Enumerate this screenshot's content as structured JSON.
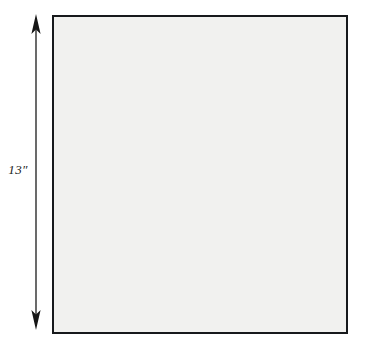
{
  "figure": {
    "kind": "astronomical-image",
    "background_color": "#ffffff"
  },
  "scale_bar": {
    "label": "13″",
    "value": 13,
    "unit": "arcsec",
    "orientation": "vertical",
    "arrowheads": "double",
    "color": "#2b2b2b",
    "top_y": 14,
    "bottom_y": 330
  },
  "image_panel": {
    "frame_color": "#17191c",
    "frame_width_px": 2,
    "left": 52,
    "top": 15,
    "width": 296,
    "height": 319,
    "colormap": "inverted-greyscale",
    "sky_background_color": "#f1f1ef",
    "star_core_color": "#111111"
  },
  "chart_data": {
    "type": "scatter",
    "title": "",
    "xlabel": "",
    "ylabel": "",
    "xlim": [
      0,
      292
    ],
    "ylim": [
      0,
      315
    ],
    "grid": false,
    "legend": null,
    "note": "Each point is a resolved star; r = core radius in px, i = peak darkness 0-1, h = halo radius in px",
    "points": [
      {
        "x": 18,
        "y": 16,
        "r": 2.0,
        "i": 0.45,
        "h": 7
      },
      {
        "x": 40,
        "y": 10,
        "r": 1.6,
        "i": 0.35,
        "h": 6
      },
      {
        "x": 8,
        "y": 56,
        "r": 6.5,
        "i": 0.86,
        "h": 20
      },
      {
        "x": 58,
        "y": 30,
        "r": 2.2,
        "i": 0.5,
        "h": 8
      },
      {
        "x": 86,
        "y": 22,
        "r": 1.8,
        "i": 0.4,
        "h": 7
      },
      {
        "x": 110,
        "y": 14,
        "r": 2.6,
        "i": 0.55,
        "h": 9
      },
      {
        "x": 134,
        "y": 34,
        "r": 2.0,
        "i": 0.45,
        "h": 7
      },
      {
        "x": 152,
        "y": 12,
        "r": 1.7,
        "i": 0.38,
        "h": 6
      },
      {
        "x": 176,
        "y": 26,
        "r": 3.0,
        "i": 0.6,
        "h": 10
      },
      {
        "x": 196,
        "y": 8,
        "r": 5.2,
        "i": 0.88,
        "h": 16
      },
      {
        "x": 214,
        "y": 44,
        "r": 2.4,
        "i": 0.52,
        "h": 9
      },
      {
        "x": 232,
        "y": 20,
        "r": 4.6,
        "i": 0.8,
        "h": 15
      },
      {
        "x": 254,
        "y": 12,
        "r": 2.0,
        "i": 0.45,
        "h": 7
      },
      {
        "x": 274,
        "y": 34,
        "r": 2.8,
        "i": 0.58,
        "h": 10
      },
      {
        "x": 286,
        "y": 14,
        "r": 1.8,
        "i": 0.4,
        "h": 6
      },
      {
        "x": 30,
        "y": 74,
        "r": 2.2,
        "i": 0.48,
        "h": 8
      },
      {
        "x": 54,
        "y": 62,
        "r": 1.8,
        "i": 0.4,
        "h": 7
      },
      {
        "x": 76,
        "y": 80,
        "r": 4.4,
        "i": 0.78,
        "h": 14
      },
      {
        "x": 96,
        "y": 58,
        "r": 2.0,
        "i": 0.44,
        "h": 7
      },
      {
        "x": 120,
        "y": 72,
        "r": 2.6,
        "i": 0.55,
        "h": 9
      },
      {
        "x": 140,
        "y": 60,
        "r": 1.9,
        "i": 0.42,
        "h": 7
      },
      {
        "x": 162,
        "y": 84,
        "r": 3.4,
        "i": 0.66,
        "h": 12
      },
      {
        "x": 184,
        "y": 66,
        "r": 2.1,
        "i": 0.46,
        "h": 8
      },
      {
        "x": 206,
        "y": 88,
        "r": 2.9,
        "i": 0.58,
        "h": 10
      },
      {
        "x": 228,
        "y": 70,
        "r": 2.3,
        "i": 0.5,
        "h": 8
      },
      {
        "x": 248,
        "y": 92,
        "r": 3.6,
        "i": 0.7,
        "h": 12
      },
      {
        "x": 268,
        "y": 64,
        "r": 2.0,
        "i": 0.44,
        "h": 7
      },
      {
        "x": 284,
        "y": 82,
        "r": 2.5,
        "i": 0.54,
        "h": 9
      },
      {
        "x": 12,
        "y": 96,
        "r": 2.0,
        "i": 0.44,
        "h": 7
      },
      {
        "x": 34,
        "y": 112,
        "r": 2.4,
        "i": 0.52,
        "h": 9
      },
      {
        "x": 58,
        "y": 104,
        "r": 1.8,
        "i": 0.4,
        "h": 7
      },
      {
        "x": 82,
        "y": 120,
        "r": 2.7,
        "i": 0.56,
        "h": 10
      },
      {
        "x": 104,
        "y": 100,
        "r": 5.6,
        "i": 0.9,
        "h": 18
      },
      {
        "x": 126,
        "y": 118,
        "r": 2.2,
        "i": 0.48,
        "h": 8
      },
      {
        "x": 146,
        "y": 102,
        "r": 3.2,
        "i": 0.64,
        "h": 11
      },
      {
        "x": 168,
        "y": 124,
        "r": 2.0,
        "i": 0.45,
        "h": 7
      },
      {
        "x": 188,
        "y": 106,
        "r": 4.0,
        "i": 0.74,
        "h": 13
      },
      {
        "x": 210,
        "y": 128,
        "r": 2.5,
        "i": 0.53,
        "h": 9
      },
      {
        "x": 234,
        "y": 108,
        "r": 3.0,
        "i": 0.62,
        "h": 10
      },
      {
        "x": 256,
        "y": 126,
        "r": 2.2,
        "i": 0.48,
        "h": 8
      },
      {
        "x": 278,
        "y": 104,
        "r": 2.8,
        "i": 0.58,
        "h": 10
      },
      {
        "x": 16,
        "y": 140,
        "r": 2.6,
        "i": 0.55,
        "h": 9
      },
      {
        "x": 44,
        "y": 152,
        "r": 2.0,
        "i": 0.44,
        "h": 7
      },
      {
        "x": 68,
        "y": 136,
        "r": 1.9,
        "i": 0.42,
        "h": 7
      },
      {
        "x": 92,
        "y": 156,
        "r": 2.4,
        "i": 0.52,
        "h": 9
      },
      {
        "x": 116,
        "y": 142,
        "r": 4.2,
        "i": 0.76,
        "h": 14
      },
      {
        "x": 138,
        "y": 160,
        "r": 2.1,
        "i": 0.46,
        "h": 8
      },
      {
        "x": 160,
        "y": 138,
        "r": 2.9,
        "i": 0.6,
        "h": 10
      },
      {
        "x": 182,
        "y": 158,
        "r": 2.3,
        "i": 0.5,
        "h": 8
      },
      {
        "x": 204,
        "y": 144,
        "r": 3.4,
        "i": 0.67,
        "h": 12
      },
      {
        "x": 226,
        "y": 164,
        "r": 2.0,
        "i": 0.44,
        "h": 7
      },
      {
        "x": 250,
        "y": 146,
        "r": 4.8,
        "i": 0.84,
        "h": 16
      },
      {
        "x": 272,
        "y": 162,
        "r": 2.6,
        "i": 0.55,
        "h": 9
      },
      {
        "x": 288,
        "y": 140,
        "r": 2.0,
        "i": 0.44,
        "h": 7
      },
      {
        "x": 21,
        "y": 187,
        "r": 9.5,
        "i": 0.97,
        "h": 30
      },
      {
        "x": 52,
        "y": 180,
        "r": 2.0,
        "i": 0.44,
        "h": 7
      },
      {
        "x": 74,
        "y": 196,
        "r": 2.4,
        "i": 0.52,
        "h": 9
      },
      {
        "x": 98,
        "y": 182,
        "r": 1.9,
        "i": 0.42,
        "h": 7
      },
      {
        "x": 122,
        "y": 200,
        "r": 2.7,
        "i": 0.57,
        "h": 10
      },
      {
        "x": 144,
        "y": 184,
        "r": 2.2,
        "i": 0.48,
        "h": 8
      },
      {
        "x": 166,
        "y": 204,
        "r": 3.0,
        "i": 0.62,
        "h": 10
      },
      {
        "x": 190,
        "y": 186,
        "r": 2.5,
        "i": 0.53,
        "h": 9
      },
      {
        "x": 212,
        "y": 206,
        "r": 2.1,
        "i": 0.46,
        "h": 8
      },
      {
        "x": 236,
        "y": 188,
        "r": 3.8,
        "i": 0.72,
        "h": 13
      },
      {
        "x": 258,
        "y": 208,
        "r": 2.3,
        "i": 0.5,
        "h": 8
      },
      {
        "x": 280,
        "y": 190,
        "r": 4.4,
        "i": 0.78,
        "h": 14
      },
      {
        "x": 14,
        "y": 226,
        "r": 2.2,
        "i": 0.48,
        "h": 8
      },
      {
        "x": 38,
        "y": 244,
        "r": 1.8,
        "i": 0.4,
        "h": 7
      },
      {
        "x": 62,
        "y": 228,
        "r": 2.6,
        "i": 0.55,
        "h": 9
      },
      {
        "x": 86,
        "y": 248,
        "r": 2.0,
        "i": 0.44,
        "h": 7
      },
      {
        "x": 110,
        "y": 232,
        "r": 3.2,
        "i": 0.64,
        "h": 11
      },
      {
        "x": 132,
        "y": 252,
        "r": 2.4,
        "i": 0.51,
        "h": 9
      },
      {
        "x": 156,
        "y": 230,
        "r": 6.2,
        "i": 0.92,
        "h": 20
      },
      {
        "x": 180,
        "y": 250,
        "r": 2.1,
        "i": 0.46,
        "h": 8
      },
      {
        "x": 202,
        "y": 234,
        "r": 2.8,
        "i": 0.58,
        "h": 10
      },
      {
        "x": 224,
        "y": 254,
        "r": 2.0,
        "i": 0.44,
        "h": 7
      },
      {
        "x": 248,
        "y": 236,
        "r": 3.6,
        "i": 0.7,
        "h": 12
      },
      {
        "x": 270,
        "y": 256,
        "r": 2.5,
        "i": 0.53,
        "h": 9
      },
      {
        "x": 288,
        "y": 234,
        "r": 2.2,
        "i": 0.48,
        "h": 8
      },
      {
        "x": 24,
        "y": 274,
        "r": 4.6,
        "i": 0.8,
        "h": 15
      },
      {
        "x": 48,
        "y": 292,
        "r": 2.0,
        "i": 0.44,
        "h": 7
      },
      {
        "x": 72,
        "y": 276,
        "r": 2.4,
        "i": 0.52,
        "h": 9
      },
      {
        "x": 96,
        "y": 296,
        "r": 1.9,
        "i": 0.42,
        "h": 7
      },
      {
        "x": 118,
        "y": 278,
        "r": 2.7,
        "i": 0.56,
        "h": 10
      },
      {
        "x": 142,
        "y": 298,
        "r": 2.2,
        "i": 0.48,
        "h": 8
      },
      {
        "x": 164,
        "y": 280,
        "r": 3.0,
        "i": 0.62,
        "h": 10
      },
      {
        "x": 186,
        "y": 300,
        "r": 2.0,
        "i": 0.45,
        "h": 7
      },
      {
        "x": 208,
        "y": 282,
        "r": 4.0,
        "i": 0.75,
        "h": 13
      },
      {
        "x": 232,
        "y": 302,
        "r": 2.3,
        "i": 0.5,
        "h": 8
      },
      {
        "x": 254,
        "y": 284,
        "r": 2.6,
        "i": 0.55,
        "h": 9
      },
      {
        "x": 276,
        "y": 304,
        "r": 2.1,
        "i": 0.46,
        "h": 8
      },
      {
        "x": 30,
        "y": 60,
        "r": 1.4,
        "i": 0.28,
        "h": 5
      },
      {
        "x": 66,
        "y": 46,
        "r": 1.3,
        "i": 0.26,
        "h": 5
      },
      {
        "x": 100,
        "y": 40,
        "r": 1.5,
        "i": 0.3,
        "h": 5
      },
      {
        "x": 128,
        "y": 52,
        "r": 1.3,
        "i": 0.25,
        "h": 5
      },
      {
        "x": 158,
        "y": 48,
        "r": 1.4,
        "i": 0.28,
        "h": 5
      },
      {
        "x": 192,
        "y": 40,
        "r": 1.2,
        "i": 0.24,
        "h": 4
      },
      {
        "x": 220,
        "y": 56,
        "r": 1.5,
        "i": 0.3,
        "h": 5
      },
      {
        "x": 244,
        "y": 48,
        "r": 1.3,
        "i": 0.26,
        "h": 5
      },
      {
        "x": 266,
        "y": 50,
        "r": 1.4,
        "i": 0.28,
        "h": 5
      },
      {
        "x": 44,
        "y": 90,
        "r": 1.3,
        "i": 0.26,
        "h": 5
      },
      {
        "x": 68,
        "y": 96,
        "r": 1.5,
        "i": 0.31,
        "h": 5
      },
      {
        "x": 90,
        "y": 88,
        "r": 1.2,
        "i": 0.24,
        "h": 4
      },
      {
        "x": 112,
        "y": 90,
        "r": 1.4,
        "i": 0.28,
        "h": 5
      },
      {
        "x": 136,
        "y": 92,
        "r": 1.3,
        "i": 0.26,
        "h": 5
      },
      {
        "x": 172,
        "y": 96,
        "r": 1.5,
        "i": 0.3,
        "h": 5
      },
      {
        "x": 198,
        "y": 90,
        "r": 1.3,
        "i": 0.25,
        "h": 5
      },
      {
        "x": 222,
        "y": 94,
        "r": 1.4,
        "i": 0.29,
        "h": 5
      },
      {
        "x": 242,
        "y": 86,
        "r": 1.2,
        "i": 0.24,
        "h": 4
      },
      {
        "x": 264,
        "y": 92,
        "r": 1.5,
        "i": 0.3,
        "h": 5
      },
      {
        "x": 22,
        "y": 124,
        "r": 1.4,
        "i": 0.28,
        "h": 5
      },
      {
        "x": 46,
        "y": 132,
        "r": 1.3,
        "i": 0.26,
        "h": 5
      },
      {
        "x": 70,
        "y": 128,
        "r": 1.5,
        "i": 0.31,
        "h": 5
      },
      {
        "x": 94,
        "y": 134,
        "r": 1.2,
        "i": 0.24,
        "h": 4
      },
      {
        "x": 134,
        "y": 130,
        "r": 1.4,
        "i": 0.28,
        "h": 5
      },
      {
        "x": 156,
        "y": 120,
        "r": 1.3,
        "i": 0.26,
        "h": 5
      },
      {
        "x": 176,
        "y": 140,
        "r": 1.5,
        "i": 0.3,
        "h": 5
      },
      {
        "x": 200,
        "y": 120,
        "r": 1.2,
        "i": 0.24,
        "h": 4
      },
      {
        "x": 222,
        "y": 132,
        "r": 1.4,
        "i": 0.29,
        "h": 5
      },
      {
        "x": 244,
        "y": 128,
        "r": 1.3,
        "i": 0.26,
        "h": 5
      },
      {
        "x": 266,
        "y": 134,
        "r": 1.5,
        "i": 0.3,
        "h": 5
      },
      {
        "x": 36,
        "y": 166,
        "r": 1.3,
        "i": 0.26,
        "h": 5
      },
      {
        "x": 60,
        "y": 170,
        "r": 1.4,
        "i": 0.28,
        "h": 5
      },
      {
        "x": 84,
        "y": 164,
        "r": 1.2,
        "i": 0.24,
        "h": 4
      },
      {
        "x": 108,
        "y": 172,
        "r": 1.5,
        "i": 0.3,
        "h": 5
      },
      {
        "x": 130,
        "y": 168,
        "r": 1.3,
        "i": 0.26,
        "h": 5
      },
      {
        "x": 152,
        "y": 174,
        "r": 1.4,
        "i": 0.28,
        "h": 5
      },
      {
        "x": 176,
        "y": 168,
        "r": 1.2,
        "i": 0.24,
        "h": 4
      },
      {
        "x": 198,
        "y": 176,
        "r": 1.5,
        "i": 0.31,
        "h": 5
      },
      {
        "x": 220,
        "y": 170,
        "r": 1.3,
        "i": 0.26,
        "h": 5
      },
      {
        "x": 242,
        "y": 174,
        "r": 1.4,
        "i": 0.28,
        "h": 5
      },
      {
        "x": 264,
        "y": 168,
        "r": 1.2,
        "i": 0.24,
        "h": 4
      },
      {
        "x": 286,
        "y": 172,
        "r": 1.5,
        "i": 0.3,
        "h": 5
      },
      {
        "x": 44,
        "y": 206,
        "r": 1.4,
        "i": 0.28,
        "h": 5
      },
      {
        "x": 64,
        "y": 214,
        "r": 1.3,
        "i": 0.26,
        "h": 5
      },
      {
        "x": 88,
        "y": 210,
        "r": 1.5,
        "i": 0.3,
        "h": 5
      },
      {
        "x": 112,
        "y": 216,
        "r": 1.2,
        "i": 0.24,
        "h": 4
      },
      {
        "x": 136,
        "y": 212,
        "r": 1.4,
        "i": 0.28,
        "h": 5
      },
      {
        "x": 158,
        "y": 218,
        "r": 1.3,
        "i": 0.26,
        "h": 5
      },
      {
        "x": 180,
        "y": 212,
        "r": 1.5,
        "i": 0.31,
        "h": 5
      },
      {
        "x": 204,
        "y": 220,
        "r": 1.2,
        "i": 0.24,
        "h": 4
      },
      {
        "x": 228,
        "y": 214,
        "r": 1.4,
        "i": 0.28,
        "h": 5
      },
      {
        "x": 250,
        "y": 220,
        "r": 1.3,
        "i": 0.26,
        "h": 5
      },
      {
        "x": 272,
        "y": 216,
        "r": 1.5,
        "i": 0.3,
        "h": 5
      },
      {
        "x": 30,
        "y": 258,
        "r": 1.3,
        "i": 0.26,
        "h": 5
      },
      {
        "x": 54,
        "y": 264,
        "r": 1.4,
        "i": 0.28,
        "h": 5
      },
      {
        "x": 78,
        "y": 260,
        "r": 1.2,
        "i": 0.24,
        "h": 4
      },
      {
        "x": 102,
        "y": 266,
        "r": 1.5,
        "i": 0.3,
        "h": 5
      },
      {
        "x": 124,
        "y": 262,
        "r": 1.3,
        "i": 0.26,
        "h": 5
      },
      {
        "x": 148,
        "y": 268,
        "r": 1.4,
        "i": 0.28,
        "h": 5
      },
      {
        "x": 172,
        "y": 262,
        "r": 1.2,
        "i": 0.24,
        "h": 4
      },
      {
        "x": 194,
        "y": 268,
        "r": 1.5,
        "i": 0.31,
        "h": 5
      },
      {
        "x": 216,
        "y": 264,
        "r": 1.3,
        "i": 0.26,
        "h": 5
      },
      {
        "x": 240,
        "y": 268,
        "r": 1.4,
        "i": 0.28,
        "h": 5
      },
      {
        "x": 262,
        "y": 262,
        "r": 1.2,
        "i": 0.24,
        "h": 4
      },
      {
        "x": 284,
        "y": 268,
        "r": 1.5,
        "i": 0.3,
        "h": 5
      },
      {
        "x": 36,
        "y": 308,
        "r": 1.4,
        "i": 0.28,
        "h": 5
      },
      {
        "x": 60,
        "y": 312,
        "r": 1.3,
        "i": 0.26,
        "h": 5
      },
      {
        "x": 84,
        "y": 306,
        "r": 1.5,
        "i": 0.3,
        "h": 5
      },
      {
        "x": 108,
        "y": 310,
        "r": 1.2,
        "i": 0.24,
        "h": 4
      },
      {
        "x": 130,
        "y": 308,
        "r": 1.4,
        "i": 0.28,
        "h": 5
      },
      {
        "x": 154,
        "y": 310,
        "r": 1.3,
        "i": 0.26,
        "h": 5
      },
      {
        "x": 178,
        "y": 306,
        "r": 1.5,
        "i": 0.31,
        "h": 5
      },
      {
        "x": 200,
        "y": 310,
        "r": 1.2,
        "i": 0.24,
        "h": 4
      },
      {
        "x": 222,
        "y": 306,
        "r": 1.4,
        "i": 0.28,
        "h": 5
      },
      {
        "x": 246,
        "y": 312,
        "r": 1.3,
        "i": 0.26,
        "h": 5
      },
      {
        "x": 268,
        "y": 308,
        "r": 1.5,
        "i": 0.3,
        "h": 5
      },
      {
        "x": 286,
        "y": 302,
        "r": 1.2,
        "i": 0.24,
        "h": 4
      },
      {
        "x": 10,
        "y": 10,
        "r": 1.3,
        "i": 0.26,
        "h": 5
      },
      {
        "x": 282,
        "y": 232,
        "r": 1.4,
        "i": 0.28,
        "h": 5
      },
      {
        "x": 6,
        "y": 160,
        "r": 1.3,
        "i": 0.26,
        "h": 5
      },
      {
        "x": 6,
        "y": 300,
        "r": 1.4,
        "i": 0.28,
        "h": 5
      }
    ]
  }
}
